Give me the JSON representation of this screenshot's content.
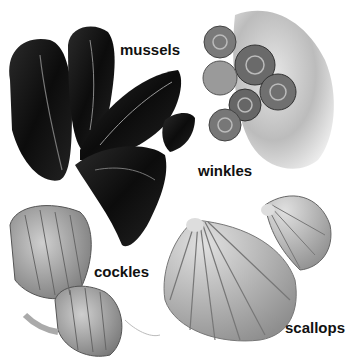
{
  "labels": {
    "mussels": "mussels",
    "winkles": "winkles",
    "cockles": "cockles",
    "scallops": "scallops"
  },
  "colors": {
    "background": "#ffffff",
    "mussel_shell": "#141414",
    "winkle_shell": "#6e6e6e",
    "rock": "#bdbdbd",
    "cockle_shell": "#9a9a9a",
    "scallop_shell": "#a8a8a8",
    "label_text": "#111111"
  }
}
